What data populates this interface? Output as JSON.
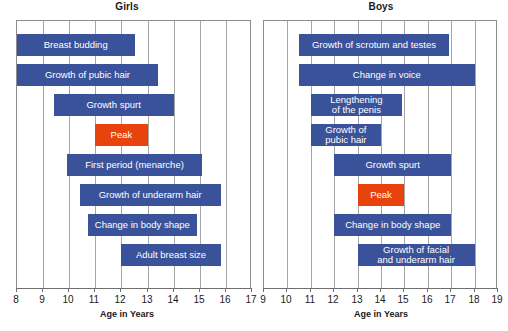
{
  "chart_data": [
    {
      "type": "bar",
      "orientation": "horizontal-range",
      "title": "Girls",
      "xlabel": "Age in Years",
      "ylabel": "",
      "xlim": [
        8,
        17
      ],
      "xticks": [
        8,
        9,
        10,
        11,
        12,
        13,
        14,
        15,
        16,
        17
      ],
      "grid": true,
      "legend": "none",
      "categories": [
        "Breast budding",
        "Growth of pubic hair",
        "Growth spurt",
        "Peak",
        "First period (menarche)",
        "Growth of underarm hair",
        "Change in body shape",
        "Adult breast size"
      ],
      "bars": [
        {
          "label": "Breast budding",
          "start": 8.0,
          "end": 12.5,
          "color": "#3a5299"
        },
        {
          "label": "Growth of pubic hair",
          "start": 8.0,
          "end": 13.4,
          "color": "#3a5299"
        },
        {
          "label": "Growth spurt",
          "start": 9.4,
          "end": 14.0,
          "color": "#3a5299"
        },
        {
          "label": "Peak",
          "start": 11.0,
          "end": 13.0,
          "color": "#e8430c"
        },
        {
          "label": "First period (menarche)",
          "start": 9.9,
          "end": 15.1,
          "color": "#3a5299"
        },
        {
          "label": "Growth of underarm hair",
          "start": 10.4,
          "end": 15.8,
          "color": "#3a5299"
        },
        {
          "label": "Change in body shape",
          "start": 10.7,
          "end": 14.9,
          "color": "#3a5299"
        },
        {
          "label": "Adult breast size",
          "start": 12.0,
          "end": 15.8,
          "color": "#3a5299"
        }
      ]
    },
    {
      "type": "bar",
      "orientation": "horizontal-range",
      "title": "Boys",
      "xlabel": "Age in Years",
      "ylabel": "",
      "xlim": [
        9,
        19
      ],
      "xticks": [
        9,
        10,
        11,
        12,
        13,
        14,
        15,
        16,
        17,
        18,
        19
      ],
      "grid": true,
      "legend": "none",
      "categories": [
        "Growth of scrotum and testes",
        "Change in voice",
        "Lengthening\nof the penis",
        "Growth of\npubic hair",
        "Growth spurt",
        "Peak",
        "Change in body shape",
        "Growth of facial\nand underarm hair"
      ],
      "bars": [
        {
          "label": "Growth of scrotum and testes",
          "start": 10.5,
          "end": 16.9,
          "color": "#3a5299"
        },
        {
          "label": "Change in voice",
          "start": 10.5,
          "end": 18.0,
          "color": "#3a5299"
        },
        {
          "label": "Lengthening\nof the penis",
          "start": 11.0,
          "end": 14.9,
          "color": "#3a5299"
        },
        {
          "label": "Growth of\npubic hair",
          "start": 11.0,
          "end": 14.0,
          "color": "#3a5299"
        },
        {
          "label": "Growth spurt",
          "start": 12.0,
          "end": 17.0,
          "color": "#3a5299"
        },
        {
          "label": "Peak",
          "start": 13.0,
          "end": 15.0,
          "color": "#e8430c"
        },
        {
          "label": "Change in body shape",
          "start": 12.0,
          "end": 17.0,
          "color": "#3a5299"
        },
        {
          "label": "Growth of facial\nand underarm hair",
          "start": 13.0,
          "end": 18.0,
          "color": "#3a5299"
        }
      ]
    }
  ],
  "colors": {
    "bar_blue": "#3a5299",
    "bar_orange": "#e8430c",
    "grid": "#a6a6a6",
    "frame": "#8d8d8d",
    "text": "#1a1a1a"
  }
}
